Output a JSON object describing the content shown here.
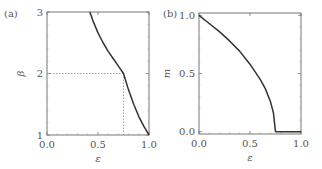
{
  "chart_data": [
    {
      "panel_label": "(a)",
      "type": "line",
      "xlabel": "ε",
      "ylabel": "β",
      "xlim": [
        0.0,
        1.0
      ],
      "ylim": [
        1,
        3
      ],
      "xticks": [
        "0.0",
        "0.5",
        "1.0"
      ],
      "yticks": [
        "1",
        "2",
        "3"
      ],
      "grid": false,
      "series": [
        {
          "name": "beta",
          "x": [
            0.42,
            0.45,
            0.5,
            0.55,
            0.6,
            0.65,
            0.7,
            0.75,
            0.8,
            0.85,
            0.9,
            0.95,
            1.0
          ],
          "y": [
            3.0,
            2.86,
            2.66,
            2.5,
            2.36,
            2.24,
            2.12,
            2.0,
            1.73,
            1.5,
            1.3,
            1.14,
            1.0
          ]
        }
      ],
      "annotations": [
        {
          "type": "dotted-line",
          "from": [
            0.0,
            2.0
          ],
          "to": [
            0.75,
            2.0
          ]
        },
        {
          "type": "dotted-line",
          "from": [
            0.75,
            1.0
          ],
          "to": [
            0.75,
            2.0
          ]
        }
      ]
    },
    {
      "panel_label": "(b)",
      "type": "line",
      "xlabel": "ε",
      "ylabel": "m",
      "xlim": [
        0.0,
        1.0
      ],
      "ylim": [
        -0.02,
        1.02
      ],
      "xticks": [
        "0.0",
        "0.5",
        "1.0"
      ],
      "yticks": [
        "0.0",
        "0.5",
        "1.0"
      ],
      "grid": false,
      "series": [
        {
          "name": "m",
          "x": [
            0.0,
            0.1,
            0.2,
            0.3,
            0.4,
            0.5,
            0.6,
            0.65,
            0.7,
            0.73,
            0.75,
            0.75,
            1.0
          ],
          "y": [
            1.0,
            0.93,
            0.86,
            0.78,
            0.69,
            0.58,
            0.45,
            0.37,
            0.26,
            0.16,
            0.0,
            0.0,
            0.0
          ]
        }
      ]
    }
  ]
}
